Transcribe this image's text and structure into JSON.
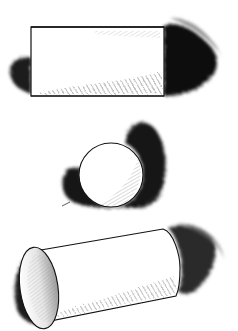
{
  "artwork": {
    "subject": "pen-and-ink shading study of three geometric solids",
    "objects": [
      {
        "name": "rectangular block",
        "shadow_side": "right"
      },
      {
        "name": "sphere",
        "shadow_side": "right and lower-left"
      },
      {
        "name": "cylinder",
        "shadow_side": "right"
      }
    ],
    "colors": {
      "background": "#ffffff",
      "ink": "#111111",
      "shadow": "#1a1a1a",
      "hatch": "#555555"
    }
  }
}
